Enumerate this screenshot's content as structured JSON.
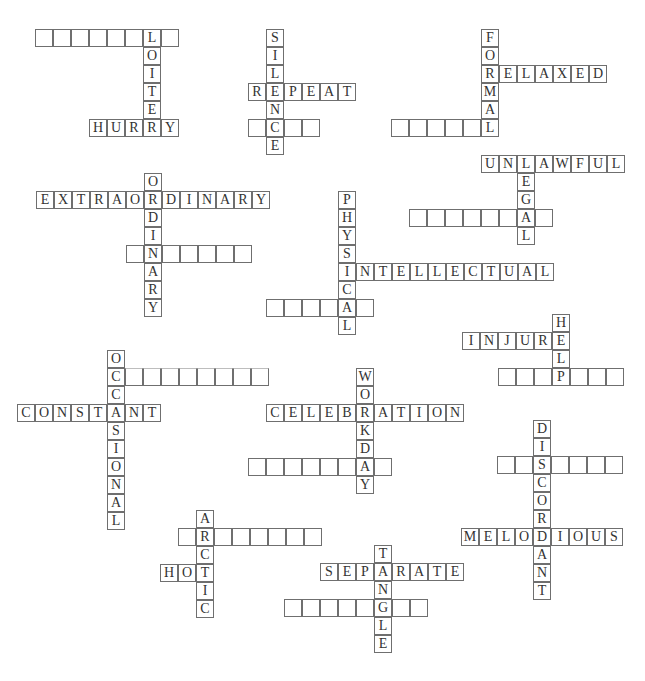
{
  "puzzle": {
    "cell_size": 18,
    "colors": {
      "border": "#6f6f6f",
      "text": "#333333",
      "background": "#ffffff"
    },
    "clusters": [
      {
        "name": "loiter",
        "words": [
          {
            "id": "loiter-blank-row",
            "dir": "across",
            "x": 35,
            "y": 29,
            "cells": [
              "",
              "",
              "",
              "",
              "",
              "",
              "L",
              ""
            ]
          },
          {
            "id": "loiter",
            "dir": "down",
            "x": 143,
            "y": 47,
            "cells": [
              "O",
              "I",
              "T",
              "E"
            ]
          },
          {
            "id": "hurry",
            "dir": "across",
            "x": 89,
            "y": 119,
            "cells": [
              "H",
              "U",
              "R",
              "R",
              "Y"
            ]
          }
        ]
      },
      {
        "name": "silence",
        "words": [
          {
            "id": "silence",
            "dir": "down",
            "x": 266,
            "y": 29,
            "cells": [
              "S",
              "I",
              "L",
              "E",
              "N",
              "C",
              "E"
            ]
          },
          {
            "id": "repeat",
            "dir": "across",
            "x": 248,
            "y": 83,
            "cells": [
              "R",
              "",
              "P",
              "E",
              "A",
              "T"
            ],
            "skip": [
              1
            ]
          },
          {
            "id": "silence-blank-row",
            "dir": "across",
            "x": 248,
            "y": 119,
            "cells": [
              "",
              "",
              "",
              ""
            ],
            "skip": [
              1
            ]
          }
        ]
      },
      {
        "name": "formal",
        "words": [
          {
            "id": "formal",
            "dir": "down",
            "x": 481,
            "y": 29,
            "cells": [
              "F",
              "O",
              "R",
              "M",
              "A",
              "L"
            ]
          },
          {
            "id": "relaxed",
            "dir": "across",
            "x": 499,
            "y": 65,
            "cells": [
              "E",
              "L",
              "A",
              "X",
              "E",
              "D"
            ]
          },
          {
            "id": "formal-blank-row",
            "dir": "across",
            "x": 391,
            "y": 119,
            "cells": [
              "",
              "",
              "",
              "",
              ""
            ]
          }
        ]
      },
      {
        "name": "legal",
        "words": [
          {
            "id": "unlawful",
            "dir": "across",
            "x": 481,
            "y": 155,
            "cells": [
              "U",
              "N",
              "L",
              "A",
              "W",
              "F",
              "U",
              "L"
            ]
          },
          {
            "id": "legal",
            "dir": "down",
            "x": 517,
            "y": 173,
            "cells": [
              "E",
              "G",
              "A",
              "L"
            ]
          },
          {
            "id": "legal-blank-row",
            "dir": "across",
            "x": 409,
            "y": 209,
            "cells": [
              "",
              "",
              "",
              "",
              "",
              "",
              "",
              ""
            ],
            "skip": [
              6
            ]
          }
        ]
      },
      {
        "name": "ordinary",
        "words": [
          {
            "id": "ordinary",
            "dir": "down",
            "x": 144,
            "y": 173,
            "cells": [
              "O",
              "R",
              "D",
              "I",
              "N",
              "A",
              "R",
              "Y"
            ]
          },
          {
            "id": "extraordinary",
            "dir": "across",
            "x": 36,
            "y": 191,
            "cells": [
              "E",
              "X",
              "T",
              "R",
              "A",
              "O",
              "",
              "D",
              "I",
              "N",
              "A",
              "R",
              "Y"
            ],
            "skip": [
              6
            ]
          },
          {
            "id": "ordinary-blank-row",
            "dir": "across",
            "x": 126,
            "y": 245,
            "cells": [
              "",
              "",
              "",
              "",
              "",
              "",
              ""
            ],
            "skip": [
              1
            ]
          }
        ]
      },
      {
        "name": "physical",
        "words": [
          {
            "id": "physical",
            "dir": "down",
            "x": 338,
            "y": 191,
            "cells": [
              "P",
              "H",
              "Y",
              "S",
              "I",
              "C",
              "A",
              "L"
            ]
          },
          {
            "id": "intellectual",
            "dir": "across",
            "x": 338,
            "y": 263,
            "cells": [
              "",
              "N",
              "T",
              "E",
              "L",
              "L",
              "E",
              "C",
              "T",
              "U",
              "A",
              "L"
            ],
            "skip": [
              0
            ]
          },
          {
            "id": "physical-blank-row",
            "dir": "across",
            "x": 266,
            "y": 299,
            "cells": [
              "",
              "",
              "",
              "",
              "",
              ""
            ],
            "skip": [
              4
            ]
          }
        ]
      },
      {
        "name": "help",
        "words": [
          {
            "id": "help",
            "dir": "down",
            "x": 552,
            "y": 314,
            "cells": [
              "H",
              "E",
              "L",
              "P"
            ]
          },
          {
            "id": "injure",
            "dir": "across",
            "x": 462,
            "y": 332,
            "cells": [
              "I",
              "N",
              "J",
              "U",
              "R"
            ]
          },
          {
            "id": "help-blank-row",
            "dir": "across",
            "x": 498,
            "y": 368,
            "cells": [
              "",
              "",
              "",
              "",
              "",
              "",
              ""
            ],
            "skip": [
              3
            ]
          }
        ]
      },
      {
        "name": "occasional",
        "words": [
          {
            "id": "occasional",
            "dir": "down",
            "x": 107,
            "y": 350,
            "cells": [
              "O",
              "C",
              "C",
              "A",
              "S",
              "I",
              "O",
              "N",
              "A",
              "L"
            ]
          },
          {
            "id": "occasional-blank-row",
            "dir": "across",
            "x": 125,
            "y": 368,
            "cells": [
              "",
              "",
              "",
              "",
              "",
              "",
              "",
              ""
            ],
            "faint_top": true
          },
          {
            "id": "constant",
            "dir": "across",
            "x": 17,
            "y": 404,
            "cells": [
              "C",
              "O",
              "N",
              "S",
              "T",
              "",
              "N",
              "T"
            ],
            "skip": [
              5
            ]
          }
        ]
      },
      {
        "name": "workday",
        "words": [
          {
            "id": "workday",
            "dir": "down",
            "x": 356,
            "y": 368,
            "cells": [
              "W",
              "O",
              "R",
              "K",
              "D",
              "A",
              "Y"
            ]
          },
          {
            "id": "celebration",
            "dir": "across",
            "x": 266,
            "y": 404,
            "cells": [
              "C",
              "E",
              "L",
              "E",
              "B",
              "",
              "A",
              "T",
              "I",
              "O",
              "N"
            ],
            "skip": [
              5
            ]
          },
          {
            "id": "workday-blank-row",
            "dir": "across",
            "x": 248,
            "y": 458,
            "cells": [
              "",
              "",
              "",
              "",
              "",
              "",
              "",
              ""
            ],
            "skip": [
              6
            ]
          }
        ]
      },
      {
        "name": "discordant",
        "words": [
          {
            "id": "discordant",
            "dir": "down",
            "x": 533,
            "y": 420,
            "cells": [
              "D",
              "I",
              "S",
              "C",
              "O",
              "R",
              "D",
              "A",
              "N",
              "T"
            ]
          },
          {
            "id": "discordant-blank-row",
            "dir": "across",
            "x": 497,
            "y": 456,
            "cells": [
              "",
              "",
              "",
              "",
              "",
              "",
              ""
            ],
            "skip": [
              2
            ]
          },
          {
            "id": "melodious",
            "dir": "across",
            "x": 461,
            "y": 528,
            "cells": [
              "M",
              "E",
              "L",
              "O",
              "",
              "I",
              "O",
              "U",
              "S"
            ],
            "skip": [
              4
            ]
          }
        ]
      },
      {
        "name": "arctic",
        "words": [
          {
            "id": "arctic",
            "dir": "down",
            "x": 196,
            "y": 510,
            "cells": [
              "A",
              "R",
              "C",
              "T",
              "I",
              "C"
            ]
          },
          {
            "id": "arctic-blank-row",
            "dir": "across",
            "x": 178,
            "y": 528,
            "cells": [
              "",
              "",
              "",
              "",
              "",
              "",
              "",
              ""
            ],
            "skip": [
              1
            ]
          },
          {
            "id": "hot",
            "dir": "across",
            "x": 160,
            "y": 564,
            "cells": [
              "H",
              "O"
            ]
          }
        ]
      },
      {
        "name": "tangle",
        "words": [
          {
            "id": "tangle",
            "dir": "down",
            "x": 374,
            "y": 545,
            "cells": [
              "T",
              "A",
              "N",
              "G",
              "L",
              "E"
            ]
          },
          {
            "id": "separate",
            "dir": "across",
            "x": 320,
            "y": 563,
            "cells": [
              "S",
              "E",
              "P",
              "",
              "R",
              "A",
              "T",
              "E"
            ],
            "skip": [
              3
            ]
          },
          {
            "id": "tangle-blank-row",
            "dir": "across",
            "x": 284,
            "y": 599,
            "cells": [
              "",
              "",
              "",
              "",
              "",
              "",
              "",
              ""
            ],
            "skip": [
              5
            ]
          }
        ]
      }
    ]
  }
}
